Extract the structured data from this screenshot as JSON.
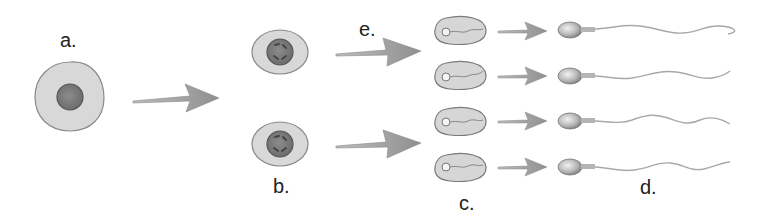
{
  "diagram": {
    "type": "spermatogenesis",
    "labels": {
      "a": "a.",
      "b": "b.",
      "c": "c.",
      "d": "d.",
      "e": "e."
    },
    "stages": [
      {
        "key": "a",
        "label": "a.",
        "count": 1,
        "shape": "round cell with single dark nucleus"
      },
      {
        "key": "b",
        "label": "b.",
        "count": 2,
        "shape": "oval cells with nucleus containing four dashes"
      },
      {
        "key": "c",
        "label": "c.",
        "count": 4,
        "shape": "elongated cells with small head and coiled flagellum"
      },
      {
        "key": "d",
        "label": "d.",
        "count": 4,
        "shape": "mature sperm with oval head and long wavy tail"
      }
    ],
    "arrow_label": "e.",
    "colors": {
      "cytoplasm": "#d8d8d8",
      "cell_outline": "#8a8a8a",
      "nucleus": "#7d7d7d",
      "nucleus_outline": "#555555",
      "arrow": "#9a9a9a",
      "tail": "#a8a8a8",
      "label": "#222222"
    }
  }
}
